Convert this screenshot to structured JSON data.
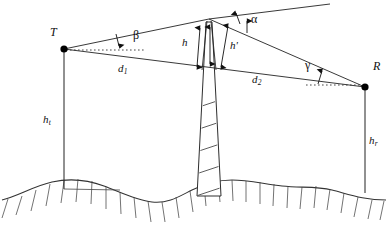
{
  "figure": {
    "type": "geometry-diagram",
    "points": {
      "transmitter": {
        "label": "T",
        "x": 63,
        "y": 49
      },
      "receiver": {
        "label": "R",
        "x": 366,
        "y": 87
      },
      "obstacle_apex": {
        "x": 209,
        "y": 19
      }
    },
    "labels": {
      "transmitter": "T",
      "receiver": "R",
      "height_obstacle": "h",
      "height_obstacle_prime": "h'",
      "height_transmitter": {
        "base": "h",
        "sub": "t"
      },
      "height_receiver": {
        "base": "h",
        "sub": "r"
      },
      "distance_1": {
        "base": "d",
        "sub": "1"
      },
      "distance_2": {
        "base": "d",
        "sub": "2"
      },
      "angle_alpha": "α",
      "angle_beta": "β",
      "angle_gamma": "γ"
    },
    "colors": {
      "line": "#222222",
      "dot": "#000000",
      "ground": "#333333",
      "background": "#ffffff"
    },
    "elements": {
      "ground_name": "wavy-hatched-terrain",
      "obstacle_name": "hatched-tower-obstacle",
      "dashed_name": "horizontal-reference-dashed-line"
    }
  }
}
